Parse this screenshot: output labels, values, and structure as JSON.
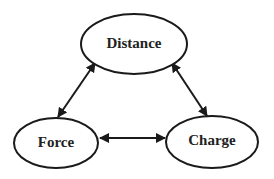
{
  "diagram": {
    "nodes": [
      {
        "id": "distance",
        "label": "Distance",
        "cx": 134,
        "cy": 44,
        "rx": 53,
        "ry": 30
      },
      {
        "id": "force",
        "label": "Force",
        "cx": 56,
        "cy": 143,
        "rx": 42,
        "ry": 25
      },
      {
        "id": "charge",
        "label": "Charge",
        "cx": 212,
        "cy": 142,
        "rx": 46,
        "ry": 26
      }
    ],
    "edges": [
      {
        "from": "force",
        "to": "distance",
        "direction": "bidirectional"
      },
      {
        "from": "distance",
        "to": "charge",
        "direction": "bidirectional"
      },
      {
        "from": "force",
        "to": "charge",
        "direction": "bidirectional"
      }
    ],
    "colors": {
      "stroke": "#1a1a1a",
      "fill": "#ffffff",
      "text": "#222222",
      "background": "#ffffff"
    }
  }
}
